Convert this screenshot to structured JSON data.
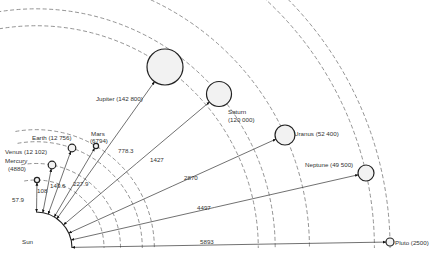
{
  "sun": {
    "label": "Sun"
  },
  "planets": [
    {
      "name": "Mercury",
      "label": "Mercury",
      "diameter_label": "(4880)",
      "distance_label": "57.9",
      "diameter_km": 4880,
      "distance_mkm": 57.9
    },
    {
      "name": "Venus",
      "label": "Venus (12 102)",
      "distance_label": "108",
      "diameter_km": 12102,
      "distance_mkm": 108
    },
    {
      "name": "Earth",
      "label": "Earth (12 756)",
      "distance_label": "149.6",
      "diameter_km": 12756,
      "distance_mkm": 149.6
    },
    {
      "name": "Mars",
      "label": "Mars",
      "diameter_label": "(6794)",
      "distance_label": "227.9",
      "diameter_km": 6794,
      "distance_mkm": 227.9
    },
    {
      "name": "Jupiter",
      "label": "Jupiter (142 800)",
      "distance_label": "778.3",
      "diameter_km": 142800,
      "distance_mkm": 778.3
    },
    {
      "name": "Saturn",
      "label": "Saturn",
      "diameter_label": "(120 000)",
      "distance_label": "1427",
      "diameter_km": 120000,
      "distance_mkm": 1427
    },
    {
      "name": "Uranus",
      "label": "Uranus (52 400)",
      "distance_label": "2870",
      "diameter_km": 52400,
      "distance_mkm": 2870
    },
    {
      "name": "Neptune",
      "label": "Neptune (49 500)",
      "distance_label": "4497",
      "diameter_km": 49500,
      "distance_mkm": 4497
    },
    {
      "name": "Pluto",
      "label": "Pluto (2500)",
      "distance_label": "5893",
      "diameter_km": 2500,
      "distance_mkm": 5893
    }
  ]
}
